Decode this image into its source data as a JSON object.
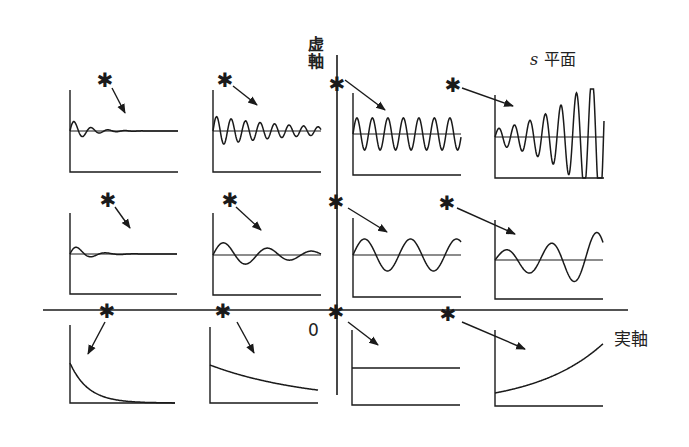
{
  "labels": {
    "imaginary_axis": "虚軸",
    "s_plane_symbol": "s",
    "s_plane_word": "平面",
    "real_axis": "実軸",
    "origin": "0"
  },
  "axes": {
    "imaginary": {
      "x": 337,
      "y1": 55,
      "y2": 395
    },
    "real": {
      "y": 310,
      "x1": 43,
      "x2": 628
    }
  },
  "pole_marker": "✱",
  "colors": {
    "ink": "#1a1a1a",
    "background": "#ffffff"
  },
  "poles": [
    {
      "id": "r1c1",
      "x": 105,
      "y": 80,
      "arrow": [
        112,
        88,
        125,
        113
      ],
      "response": "fast-decaying-oscillation"
    },
    {
      "id": "r1c2",
      "x": 225,
      "y": 80,
      "arrow": [
        233,
        86,
        257,
        105
      ],
      "response": "slow-decaying-oscillation"
    },
    {
      "id": "r1c3",
      "x": 337,
      "y": 84,
      "arrow": [
        345,
        80,
        385,
        110
      ],
      "response": "sustained-oscillation"
    },
    {
      "id": "r1c4",
      "x": 453,
      "y": 85,
      "arrow": [
        462,
        88,
        513,
        106
      ],
      "response": "growing-oscillation"
    },
    {
      "id": "r2c1",
      "x": 108,
      "y": 200,
      "arrow": [
        115,
        207,
        130,
        228
      ],
      "response": "fast-decaying-oscillation-low-freq"
    },
    {
      "id": "r2c2",
      "x": 230,
      "y": 200,
      "arrow": [
        236,
        207,
        261,
        230
      ],
      "response": "slow-decaying-oscillation-low-freq"
    },
    {
      "id": "r2c3",
      "x": 336,
      "y": 202,
      "arrow": [
        348,
        208,
        387,
        232
      ],
      "response": "sustained-oscillation-low-freq"
    },
    {
      "id": "r2c4",
      "x": 447,
      "y": 203,
      "arrow": [
        457,
        208,
        515,
        234
      ],
      "response": "growing-oscillation-low-freq"
    },
    {
      "id": "r3c1",
      "x": 107,
      "y": 311,
      "arrow": [
        105,
        322,
        88,
        354
      ],
      "response": "fast-exponential-decay"
    },
    {
      "id": "r3c2",
      "x": 223,
      "y": 311,
      "arrow": [
        237,
        322,
        254,
        353
      ],
      "response": "slow-exponential-decay"
    },
    {
      "id": "r3c3",
      "x": 336,
      "y": 312,
      "arrow": [
        348,
        322,
        378,
        345
      ],
      "response": "constant"
    },
    {
      "id": "r3c4",
      "x": 448,
      "y": 314,
      "arrow": [
        462,
        322,
        525,
        349
      ],
      "response": "exponential-growth"
    }
  ],
  "plots": [
    {
      "id": "r1c1",
      "x": 70,
      "y": 90,
      "w": 108,
      "h": 82,
      "baseline": 41,
      "type": "osc",
      "amp": 12,
      "decay": 0.06,
      "period": 17,
      "grow": false
    },
    {
      "id": "r1c2",
      "x": 213,
      "y": 90,
      "w": 108,
      "h": 82,
      "baseline": 41,
      "type": "osc",
      "amp": 15,
      "decay": 0.012,
      "period": 14.5,
      "grow": false
    },
    {
      "id": "r1c3",
      "x": 353,
      "y": 93,
      "w": 108,
      "h": 82,
      "baseline": 41,
      "type": "osc",
      "amp": 16,
      "decay": 0,
      "period": 15.5,
      "grow": false
    },
    {
      "id": "r1c4",
      "x": 495,
      "y": 95,
      "w": 109,
      "h": 83,
      "baseline": 42,
      "type": "osc",
      "amp": 8,
      "decay": 0.021,
      "period": 15.5,
      "grow": true
    },
    {
      "id": "r2c1",
      "x": 70,
      "y": 213,
      "w": 107,
      "h": 81,
      "baseline": 41,
      "type": "osc",
      "amp": 10,
      "decay": 0.06,
      "period": 29,
      "grow": false
    },
    {
      "id": "r2c2",
      "x": 213,
      "y": 213,
      "w": 108,
      "h": 82,
      "baseline": 42,
      "type": "osc",
      "amp": 14,
      "decay": 0.013,
      "period": 44,
      "grow": false
    },
    {
      "id": "r2c3",
      "x": 353,
      "y": 218,
      "w": 108,
      "h": 79,
      "baseline": 37,
      "type": "osc",
      "amp": 16,
      "decay": 0,
      "period": 46,
      "grow": false
    },
    {
      "id": "r2c4",
      "x": 495,
      "y": 220,
      "w": 108,
      "h": 79,
      "baseline": 40,
      "type": "osc",
      "amp": 9,
      "decay": 0.011,
      "period": 45,
      "grow": true
    },
    {
      "id": "r3c1",
      "x": 70,
      "y": 325,
      "w": 105,
      "h": 78,
      "baseline": 78,
      "type": "exp",
      "start": 40,
      "rate": -0.055
    },
    {
      "id": "r3c2",
      "x": 210,
      "y": 327,
      "w": 108,
      "h": 76,
      "baseline": 76,
      "type": "exp",
      "start": 38,
      "rate": -0.01
    },
    {
      "id": "r3c3",
      "x": 352,
      "y": 330,
      "w": 108,
      "h": 75,
      "baseline": 75,
      "type": "exp",
      "start": 37,
      "rate": 0
    },
    {
      "id": "r3c4",
      "x": 495,
      "y": 330,
      "w": 108,
      "h": 76,
      "baseline": 76,
      "type": "exp",
      "start": 13,
      "rate": 0.0145
    }
  ]
}
